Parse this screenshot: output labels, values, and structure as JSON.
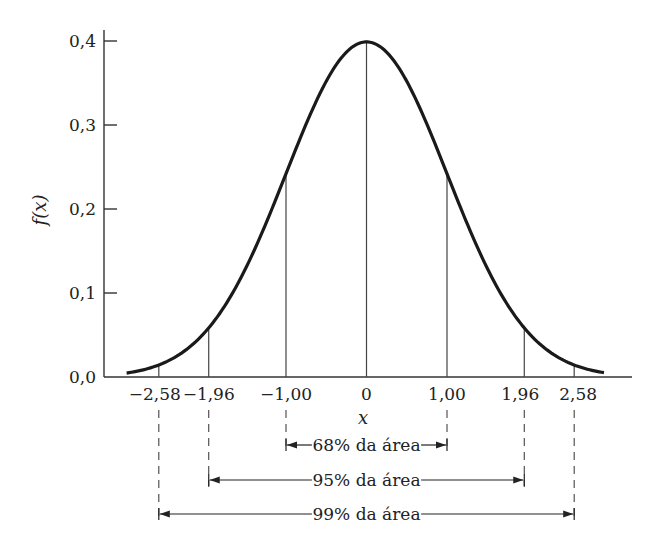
{
  "chart_data": {
    "type": "line",
    "title": "",
    "xlabel": "x",
    "ylabel": "f(x)",
    "xlim": [
      -3.0,
      3.3
    ],
    "ylim": [
      0.0,
      0.4
    ],
    "grid": false,
    "x_ticks": [
      {
        "value": -2.58,
        "label": "−2,58"
      },
      {
        "value": -1.96,
        "label": "−1,96"
      },
      {
        "value": -1.0,
        "label": "−1,00"
      },
      {
        "value": 0,
        "label": "0"
      },
      {
        "value": 1.0,
        "label": "1,00"
      },
      {
        "value": 1.96,
        "label": "1,96"
      },
      {
        "value": 2.58,
        "label": "2,58"
      }
    ],
    "y_ticks": [
      {
        "value": 0.0,
        "label": "0,0"
      },
      {
        "value": 0.1,
        "label": "0,1"
      },
      {
        "value": 0.2,
        "label": "0,2"
      },
      {
        "value": 0.3,
        "label": "0,3"
      },
      {
        "value": 0.4,
        "label": "0,4"
      }
    ],
    "series": [
      {
        "name": "f(x)",
        "x": [
          -3.0,
          -2.58,
          -1.96,
          -1.0,
          0,
          1.0,
          1.96,
          2.58,
          3.0
        ],
        "values": [
          0.004,
          0.014,
          0.058,
          0.242,
          0.399,
          0.242,
          0.058,
          0.014,
          0.004
        ]
      }
    ],
    "vertical_markers": [
      -2.58,
      -1.96,
      -1.0,
      0,
      1.0,
      1.96,
      2.58
    ],
    "annotations": [
      {
        "from": -1.0,
        "to": 1.0,
        "label": "68% da área"
      },
      {
        "from": -1.96,
        "to": 1.96,
        "label": "95% da área"
      },
      {
        "from": -2.58,
        "to": 2.58,
        "label": "99% da área"
      }
    ]
  }
}
